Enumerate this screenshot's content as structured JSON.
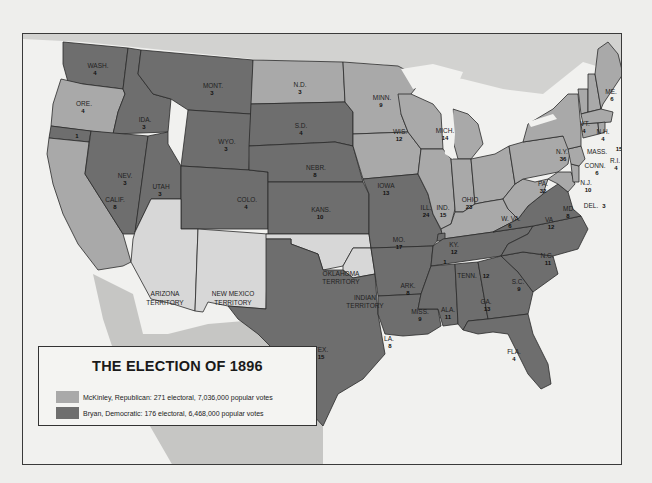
{
  "map": {
    "title": "THE ELECTION OF 1896",
    "colors": {
      "republican": "#a9a9a9",
      "democratic": "#6e6e6e",
      "territory": "#d7d7d7",
      "water": "#f1f1ef",
      "foreign": "#c6c6c6",
      "border": "#2a2a2a"
    },
    "legend": [
      {
        "party": "republican",
        "label": "McKinley, Republican: 271 electoral, 7,036,000 popular votes",
        "color": "#a9a9a9"
      },
      {
        "party": "democratic",
        "label": "Bryan, Democratic: 176 electoral, 6,468,000 popular votes",
        "color": "#6e6e6e"
      }
    ],
    "states": [
      {
        "abbr": "WASH.",
        "electoral": "4",
        "party": "democratic"
      },
      {
        "abbr": "ORE.",
        "electoral": "4",
        "party": "republican"
      },
      {
        "abbr": "CALIF.",
        "electoral": "8",
        "party": "republican",
        "note": "1 Democratic"
      },
      {
        "abbr": "IDA.",
        "electoral": "3",
        "party": "democratic"
      },
      {
        "abbr": "NEV.",
        "electoral": "3",
        "party": "democratic"
      },
      {
        "abbr": "MONT.",
        "electoral": "3",
        "party": "democratic"
      },
      {
        "abbr": "WYO.",
        "electoral": "3",
        "party": "democratic"
      },
      {
        "abbr": "UTAH",
        "electoral": "3",
        "party": "democratic"
      },
      {
        "abbr": "COLO.",
        "electoral": "4",
        "party": "democratic"
      },
      {
        "abbr": "N.D.",
        "electoral": "3",
        "party": "republican"
      },
      {
        "abbr": "S.D.",
        "electoral": "4",
        "party": "democratic"
      },
      {
        "abbr": "NEBR.",
        "electoral": "8",
        "party": "democratic"
      },
      {
        "abbr": "KANS.",
        "electoral": "10",
        "party": "democratic"
      },
      {
        "abbr": "MINN.",
        "electoral": "9",
        "party": "republican"
      },
      {
        "abbr": "IOWA",
        "electoral": "13",
        "party": "republican"
      },
      {
        "abbr": "MO.",
        "electoral": "17",
        "party": "democratic"
      },
      {
        "abbr": "ARK.",
        "electoral": "8",
        "party": "democratic"
      },
      {
        "abbr": "LA.",
        "electoral": "8",
        "party": "democratic"
      },
      {
        "abbr": "TEX.",
        "electoral": "15",
        "party": "democratic"
      },
      {
        "abbr": "WIS.",
        "electoral": "12",
        "party": "republican"
      },
      {
        "abbr": "MICH.",
        "electoral": "14",
        "party": "republican"
      },
      {
        "abbr": "ILL.",
        "electoral": "24",
        "party": "republican"
      },
      {
        "abbr": "IND.",
        "electoral": "15",
        "party": "republican"
      },
      {
        "abbr": "OHIO",
        "electoral": "23",
        "party": "republican"
      },
      {
        "abbr": "KY.",
        "electoral": "12",
        "party": "republican",
        "note": "1 Democratic"
      },
      {
        "abbr": "TENN.",
        "electoral": "12",
        "party": "democratic"
      },
      {
        "abbr": "MISS.",
        "electoral": "9",
        "party": "democratic"
      },
      {
        "abbr": "ALA.",
        "electoral": "11",
        "party": "democratic"
      },
      {
        "abbr": "GA.",
        "electoral": "13",
        "party": "democratic"
      },
      {
        "abbr": "FLA.",
        "electoral": "4",
        "party": "democratic"
      },
      {
        "abbr": "S.C.",
        "electoral": "9",
        "party": "democratic"
      },
      {
        "abbr": "N.C.",
        "electoral": "11",
        "party": "democratic"
      },
      {
        "abbr": "VA.",
        "electoral": "12",
        "party": "democratic"
      },
      {
        "abbr": "W. VA.",
        "electoral": "6",
        "party": "republican"
      },
      {
        "abbr": "MD.",
        "electoral": "8",
        "party": "republican"
      },
      {
        "abbr": "DEL.",
        "electoral": "3",
        "party": "republican"
      },
      {
        "abbr": "PA.",
        "electoral": "32",
        "party": "republican"
      },
      {
        "abbr": "N.J.",
        "electoral": "10",
        "party": "republican"
      },
      {
        "abbr": "N.Y.",
        "electoral": "36",
        "party": "republican"
      },
      {
        "abbr": "CONN.",
        "electoral": "6",
        "party": "republican"
      },
      {
        "abbr": "R.I.",
        "electoral": "4",
        "party": "republican"
      },
      {
        "abbr": "MASS.",
        "electoral": "15",
        "party": "republican"
      },
      {
        "abbr": "VT.",
        "electoral": "4",
        "party": "republican"
      },
      {
        "abbr": "N.H.",
        "electoral": "4",
        "party": "republican"
      },
      {
        "abbr": "ME.",
        "electoral": "6",
        "party": "republican"
      }
    ],
    "territories": [
      {
        "name_line1": "ARIZONA",
        "name_line2": "TERRITORY"
      },
      {
        "name_line1": "NEW MEXICO",
        "name_line2": "TERRITORY"
      },
      {
        "name_line1": "OKLAHOMA",
        "name_line2": "TERRITORY"
      },
      {
        "name_line1": "INDIAN",
        "name_line2": "TERRITORY"
      }
    ],
    "split_votes": [
      {
        "location": "CALIF.",
        "value": "1"
      },
      {
        "location": "KY.",
        "value": "1"
      }
    ]
  }
}
